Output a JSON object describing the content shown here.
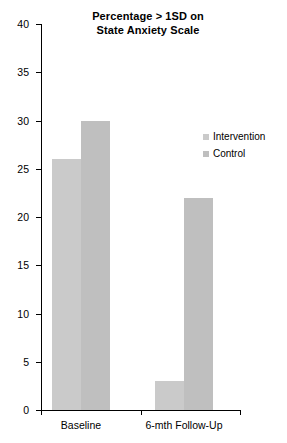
{
  "chart_data": {
    "type": "bar",
    "title": "Percentage > 1SD on State Anxiety Scale",
    "title_line1": "Percentage > 1SD on",
    "title_line2": "State Anxiety Scale",
    "xlabel": "",
    "ylabel": "",
    "categories": [
      "Baseline",
      "6-mth Follow-Up"
    ],
    "series": [
      {
        "name": "Intervention",
        "values": [
          26,
          3
        ],
        "color": "#cacaca"
      },
      {
        "name": "Control",
        "values": [
          30,
          22
        ],
        "color": "#bfbfbf"
      }
    ],
    "ylim": [
      0,
      40
    ],
    "yticks": [
      0,
      5,
      10,
      15,
      20,
      25,
      30,
      35,
      40
    ],
    "ytick_labels": [
      "0",
      "5",
      "10",
      "15",
      "20",
      "25",
      "30",
      "35",
      "40"
    ],
    "grid": false,
    "legend_position": "center-right",
    "axis_color": "#000000",
    "background": "#ffffff"
  },
  "legend": {
    "items": [
      {
        "label": "Intervention",
        "color": "#cacaca"
      },
      {
        "label": "Control",
        "color": "#bfbfbf"
      }
    ]
  }
}
